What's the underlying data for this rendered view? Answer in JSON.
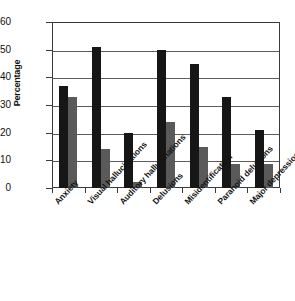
{
  "chart_data": {
    "type": "bar",
    "title": "",
    "xlabel": "",
    "ylabel": "Percentage",
    "ylim": [
      0,
      60
    ],
    "ytick_values": [
      0,
      10,
      20,
      30,
      40,
      50,
      60
    ],
    "ytick_labels": [
      "0",
      "10",
      "20",
      "30",
      "40",
      "50",
      "60"
    ],
    "grid": true,
    "legend": "none",
    "grouped": true,
    "categories": [
      "Anxiety",
      "Visual hallucinations",
      "Auditory hallucinations",
      "Delusions",
      "Misidentification",
      "Paranoid delusions",
      "Major depression"
    ],
    "series": [
      {
        "name": "Series 1",
        "color": "#161616",
        "values": [
          37,
          51,
          20,
          50,
          45,
          33,
          21
        ]
      },
      {
        "name": "Series 2",
        "color": "#5a5a5a",
        "values": [
          33,
          14,
          2,
          24,
          15,
          8.5,
          8.5
        ]
      }
    ]
  }
}
